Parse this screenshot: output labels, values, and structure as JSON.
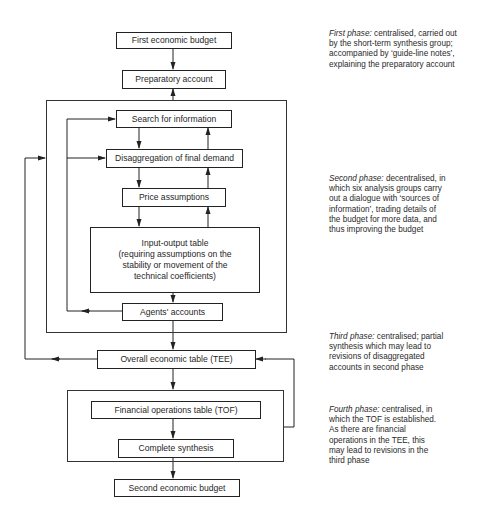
{
  "diagram": {
    "boxes": {
      "first_budget": "First economic budget",
      "preparatory_account": "Preparatory account",
      "search_information": "Search for information",
      "disaggregation": "Disaggregation of final demand",
      "price_assumptions": "Price assumptions",
      "input_output": {
        "line1": "Input-output table",
        "line2": "(requiring assumptions on the",
        "line3": "stability or movement of the",
        "line4": "technical coefficients)"
      },
      "agents_accounts": "Agents' accounts",
      "overall_table": "Overall economic table (TEE)",
      "financial_table": "Financial operations table (TOF)",
      "complete_synthesis": "Complete synthesis",
      "second_budget": "Second economic budget"
    },
    "notes": {
      "first_phase": {
        "label": "First phase:",
        "text": " centralised, carried out by the short-term synthesis group; accompanied by ‘guide-line notes’, explaining the preparatory account"
      },
      "second_phase": {
        "label": "Second phase:",
        "text": " decentralised, in which six analysis groups carry out a dialogue with ‘sources of information’, trading details of the budget for more data, and thus improving the budget"
      },
      "third_phase": {
        "label": "Third phase:",
        "text": " centralised; partial synthesis which may lead to revisions of disaggregated accounts in second phase"
      },
      "fourth_phase": {
        "label": "Fourth phase:",
        "text": " centralised, in which the TOF is established. As there are financial operations in the TEE, this may lead to revisions in the third phase"
      }
    },
    "colors": {
      "line": "#222222",
      "text": "#1f1f1f",
      "background": "#ffffff"
    }
  }
}
